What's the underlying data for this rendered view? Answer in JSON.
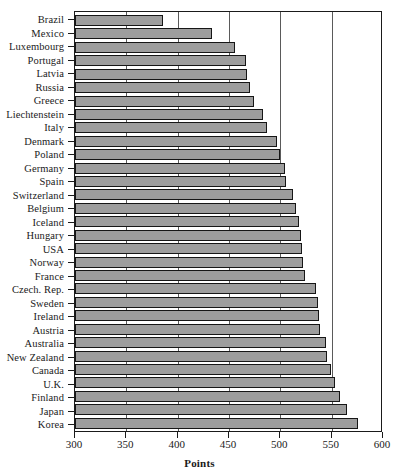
{
  "chart_data": {
    "type": "bar",
    "orientation": "horizontal",
    "title": "",
    "xlabel": "Points",
    "ylabel": "",
    "xlim": [
      300,
      600
    ],
    "ylim": null,
    "xticks": [
      300,
      350,
      400,
      450,
      500,
      550,
      600
    ],
    "grid": true,
    "grid_axis": "x",
    "legend": null,
    "bar_color": "#9d9d9d",
    "bar_edge_color": "#161616",
    "categories": [
      "Brazil",
      "Mexico",
      "Luxembourg",
      "Portugal",
      "Latvia",
      "Russia",
      "Greece",
      "Liechtenstein",
      "Italy",
      "Denmark",
      "Poland",
      "Germany",
      "Spain",
      "Switzerland",
      "Belgium",
      "Iceland",
      "Hungary",
      "USA",
      "Norway",
      "France",
      "Czech. Rep.",
      "Sweden",
      "Ireland",
      "Austria",
      "Australia",
      "New Zealand",
      "Canada",
      "U.K.",
      "Finland",
      "Japan",
      "Korea"
    ],
    "values": [
      386,
      433,
      456,
      467,
      468,
      470,
      474,
      483,
      487,
      497,
      500,
      505,
      506,
      512,
      515,
      518,
      520,
      521,
      522,
      524,
      535,
      537,
      538,
      539,
      544,
      545,
      549,
      553,
      558,
      565,
      576
    ]
  }
}
